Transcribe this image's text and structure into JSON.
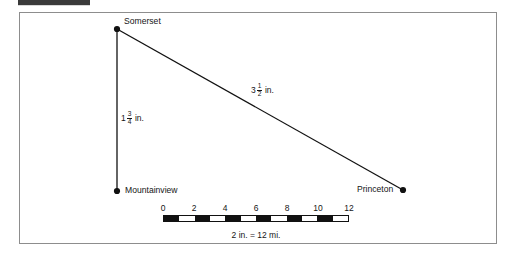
{
  "figure": {
    "type": "map-scale-diagram",
    "background_color": "#ffffff",
    "frame_color": "#8d8d8d",
    "ink_color": "#111111"
  },
  "top_strip": {
    "name": "cropped-header-bar",
    "color": "#3a3a3a"
  },
  "cities": [
    {
      "id": "somerset",
      "label": "Somerset",
      "x": 117,
      "y": 29,
      "label_side": "right"
    },
    {
      "id": "mountainview",
      "label": "Mountainview",
      "x": 117,
      "y": 191,
      "label_side": "right"
    },
    {
      "id": "princeton",
      "label": "Princeton",
      "x": 403,
      "y": 190,
      "label_side": "left"
    }
  ],
  "segments": [
    {
      "id": "somerset-mountainview",
      "from": "somerset",
      "to": "mountainview",
      "measure_whole": "1",
      "measure_numerator": "3",
      "measure_denominator": "4",
      "measure_unit": "in.",
      "measure_text": "1 3/4 in."
    },
    {
      "id": "somerset-princeton",
      "from": "somerset",
      "to": "princeton",
      "measure_whole": "3",
      "measure_numerator": "1",
      "measure_denominator": "2",
      "measure_unit": "in.",
      "measure_text": "3 1/2 in."
    }
  ],
  "scale": {
    "tick_labels": [
      "0",
      "2",
      "4",
      "6",
      "8",
      "10",
      "12"
    ],
    "tick_values": [
      0,
      2,
      4,
      6,
      8,
      10,
      12
    ],
    "min": 0,
    "max": 12,
    "segment_count": 12,
    "caption": "2 in. = 12 mi."
  },
  "chart_data": {
    "type": "diagram",
    "title": "",
    "points": [
      {
        "name": "Somerset",
        "x": 117,
        "y": 29
      },
      {
        "name": "Mountainview",
        "x": 117,
        "y": 191
      },
      {
        "name": "Princeton",
        "x": 403,
        "y": 190
      }
    ],
    "edges": [
      {
        "from": "Somerset",
        "to": "Mountainview",
        "label": "1 3/4 in."
      },
      {
        "from": "Somerset",
        "to": "Princeton",
        "label": "3 1/2 in."
      }
    ],
    "scale_bar": {
      "ticks": [
        0,
        2,
        4,
        6,
        8,
        10,
        12
      ],
      "caption": "2 in. = 12 mi."
    }
  }
}
